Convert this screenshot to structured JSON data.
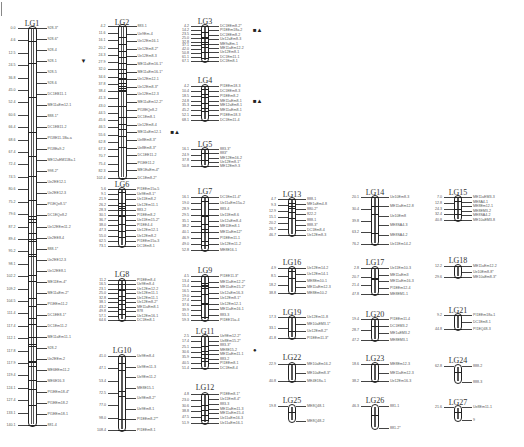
{
  "figure": {
    "caption": "",
    "linkage_groups": [
      {
        "id": "LG1",
        "x": 32,
        "title_y": 19,
        "top": 26,
        "bottom": 427,
        "scale": 2.72,
        "positions": [
          "0.0",
          "4.6",
          "12.5",
          "24.5",
          "36.8",
          "45.0",
          "52.4",
          "60.6",
          "66.4",
          "68.6",
          "67.4",
          "72.4",
          "74.5",
          "80.6",
          "75.2",
          "79.6",
          "87.2",
          "89.4",
          "95.2",
          "98.1",
          "102.2",
          "109.2",
          "104.5",
          "111.4",
          "117.4",
          "112.1",
          "117.8",
          "117.9",
          "119.4",
          "124.1",
          "127.4",
          "133.1",
          "140.1"
        ],
        "markers": [
          "928-3*",
          "928-6*",
          "928-4",
          "928-1",
          "928-5",
          "928-6",
          "DC1EB11-1",
          "ME11aEm12-1",
          "888-1*",
          "DC1EB11-2",
          "PI18E11-1Ba-a",
          "PI18Ea9-2",
          "ME12aEM11Ba-1",
          "998-2*",
          "Ue2EE12-1",
          "Ue2EE12-3",
          "PI1EQe8-5*",
          "DC1EQe8-2",
          "Ue12EEm11-2",
          "Ue2EE8-4",
          "888-1*",
          "Ue2EE12-3",
          "Ue12EE8-1",
          "ME11Em-4*",
          "ME11aEm-2*",
          "PI1EEm11-2",
          "DC1EE8-1*",
          "DC1Em11-2",
          "ME11aEm11-1",
          "928-2",
          "Ue2EEm-2",
          "ME6EEm11-2",
          "ME6E16-3",
          "PI1EEm18-4*",
          "PI1EEm18-2",
          "PI1EEm18-1",
          "881-4"
        ],
        "annotations": [
          {
            "marker_index": 3,
            "symbol": "▼"
          }
        ]
      },
      {
        "id": "LG2",
        "x": 122,
        "title_y": 18,
        "top": 24,
        "bottom": 180,
        "positions": [
          "4.2",
          "11.6",
          "16.1",
          "20.2",
          "24.3",
          "27.9",
          "32.0",
          "34.6",
          "37.8",
          "38.4",
          "41.3",
          "43.0",
          "44.5",
          "45.6",
          "46.5",
          "55.6",
          "62.8",
          "67.3",
          "70.7",
          "75.4",
          "82.3",
          "102.4"
        ],
        "markers": [
          "883-1",
          "Ue9Em-4",
          "Ue12Em16-1",
          "Ue12Em8-2*",
          "Ue12Em8-3",
          "ME11aEm16-1*",
          "ME11aEm16-1*",
          "Ue12Em12-1",
          "Ue12Em8-3*",
          "Ue12Em12-3",
          "ME11aEm12-2*",
          "PI18EQe8-2",
          "DC1Em8-1",
          "Ue12Em8-4",
          "ME11aEm12-1",
          "Ue8Em8-3*",
          "Ue8Em8-3*",
          "DC1EE11-2",
          "PI1EE11-2",
          "ME1EaEm-4*",
          "DC1Em8-2*"
        ],
        "annotations": [
          {
            "marker_index": 14,
            "symbol": "■▲"
          }
        ]
      },
      {
        "id": "LG3",
        "x": 205,
        "title_y": 17,
        "top": 24,
        "bottom": 63,
        "positions": [
          "4.2",
          "14.2",
          "23.5",
          "25.0",
          "32.8",
          "37.1",
          "42.0",
          "50.8",
          "61.1",
          "67.1"
        ],
        "markers": [
          "DC1EEm8-2*",
          "PI1EEm18a-2",
          "DC1EEm8-2",
          "Ue12aEm8-3",
          "ME9aEm-1",
          "ME11aEm12-2",
          "Ue12Em8-1",
          "DC1Em11-1",
          "DC1Em8-1"
        ],
        "annotations": [
          {
            "marker_index": 1,
            "symbol": "■▲"
          }
        ]
      },
      {
        "id": "LG4",
        "x": 205,
        "title_y": 76,
        "top": 84,
        "bottom": 122,
        "positions": [
          "4.2",
          "10.4",
          "18.5",
          "24.8",
          "35.3",
          "45.2",
          "52.1",
          "68.1"
        ],
        "markers": [
          "PI1EEm18-3",
          "DC1EEm8-3",
          "PI1EEm8-2",
          "ME11aEm8-1",
          "ME12aEm8-1",
          "ME11aEm8-1",
          "PI1EEm18-3",
          "DC1Em11-4"
        ],
        "annotations": [
          {
            "marker_index": 3,
            "symbol": "■▲"
          }
        ]
      },
      {
        "id": "LG5",
        "x": 205,
        "title_y": 140,
        "top": 147,
        "bottom": 168,
        "positions": [
          "16.1",
          "24.9",
          "37.8",
          "50.8"
        ],
        "markers": [
          "883-3*",
          "883*",
          "ME12Em16-2",
          "Ue12Em8-1*",
          "ME12Em9-3"
        ],
        "annotations": []
      },
      {
        "id": "LG6",
        "x": 122,
        "title_y": 180,
        "top": 187,
        "bottom": 248,
        "positions": [
          "5.6",
          "9.1",
          "21.9",
          "26.2",
          "28.3",
          "30.1",
          "36.7",
          "38.0",
          "47.3",
          "55.0",
          "62.5",
          "73.1"
        ],
        "markers": [
          "PI1EEm15a-5",
          "Ue9Em8-1*",
          "Ue11Em8-2",
          "Ue12Em11-1",
          "883-2",
          "PI1EEm8-2",
          "Ue11Em15-2*",
          "PI1EE4-4",
          "Ue12Em12-1",
          "Ue12Em8-2",
          "PI1EEm15a-3",
          "DC1Em8-1"
        ],
        "annotations": []
      },
      {
        "id": "LG7",
        "x": 205,
        "title_y": 187,
        "top": 195,
        "bottom": 252,
        "positions": [
          "16.1",
          "19.0",
          "28.9",
          "29.5",
          "35.1",
          "38.2",
          "40.1",
          "46.9",
          "49.0",
          "52.8"
        ],
        "markers": [
          "DC1Em11-4*",
          "Ue11aEm15a-2",
          "883-4",
          "Ue11Em8-6",
          "Ue12aEm8-4",
          "ME11Em8-1",
          "ME11aEm12*",
          "PI1EEm11-1",
          "Ue12Em11-2",
          "ME8E16-1"
        ],
        "annotations": []
      },
      {
        "id": "LG8",
        "x": 122,
        "title_y": 270,
        "top": 278,
        "bottom": 322,
        "positions": [
          "11.2",
          "16.5",
          "23.1",
          "25.0",
          "32.8",
          "38.1",
          "43.2",
          "49.8",
          "57.1",
          "64.6"
        ],
        "markers": [
          "PI1EEm8-4",
          "Ue9Em8-4",
          "Ue12Em12-2",
          "Ue12Em11-1",
          "Ue12Em11-1",
          "Ue12Em8-2*",
          "ME11aEm8-1",
          "878",
          "Ue12Em16-1",
          "DC1Em8-1"
        ],
        "annotations": []
      },
      {
        "id": "LG9",
        "x": 205,
        "title_y": 266,
        "top": 274,
        "bottom": 322,
        "positions": [
          "4.5",
          "13.4",
          "15.4",
          "16.5",
          "19.0",
          "27.4",
          "37.6",
          "39.9",
          "55.1",
          "59.3"
        ],
        "markers": [
          "PI1EE11-3*",
          "ME11aEm12-2*",
          "ME11aEm15-2*",
          "Ue12aEm16-3",
          "Ue12Em8-1*",
          "Ue12Em12-1",
          "ME11aEm16-1",
          "883-3",
          "PI1EE15a-4"
        ],
        "annotations": []
      },
      {
        "id": "LG10",
        "x": 122,
        "title_y": 346,
        "top": 354,
        "bottom": 432,
        "positions": [
          "41.0",
          "47.1",
          "53.4",
          "72.5",
          "77.0",
          "98.0",
          "108.4"
        ],
        "markers": [
          "Ue9Em8-4",
          "Ue9Em11-3",
          "Ue9Em11-2",
          "ME8E15-1",
          "Ue9Em8-2*",
          "Ue9Em8-1",
          "PI1EEm8-2**",
          "PI1EEm8-1"
        ],
        "annotations": []
      },
      {
        "id": "LG11",
        "x": 205,
        "title_y": 327,
        "top": 334,
        "bottom": 370,
        "positions": [
          "2.5",
          "17.4",
          "25.1",
          "30.6",
          "35.9",
          "40.5",
          "51.4"
        ],
        "markers": [
          "Ue9Em12-2*",
          "Ue8Em15-2*",
          "883-3*",
          "ME8E15-2",
          "ME11aEm11-1",
          "883-2",
          "PI1EEm8-1",
          "DC1Em8-4"
        ],
        "annotations": [
          {
            "marker_index": 3,
            "symbol": "●"
          }
        ]
      },
      {
        "id": "LG12",
        "x": 205,
        "title_y": 383,
        "top": 392,
        "bottom": 425,
        "positions": [
          "4.8",
          "23.0",
          "30.6",
          "38.8",
          "47.5",
          "51.9"
        ],
        "markers": [
          "PI1EEm8-1*",
          "Ue11Em8-4*",
          "883-3",
          "ME11aEm11-3",
          "ME11aEm15-4",
          "Ue11aEm16-3",
          "Ue11aEm16-1"
        ],
        "annotations": []
      },
      {
        "id": "LG13",
        "x": 292,
        "title_y": 190,
        "top": 197,
        "bottom": 237,
        "positions": [
          "4.7",
          "9.3",
          "12.9",
          "15.1",
          "20.2",
          "26.7",
          "46.7"
        ],
        "markers": [
          "888-1",
          "ME1aEm4-8",
          "880-2*",
          "822-2",
          "888-1",
          "888-3*",
          "DC1Em8-4",
          "Ue12Em8-3"
        ],
        "annotations": []
      },
      {
        "id": "LG14",
        "x": 375,
        "title_y": 188,
        "top": 195,
        "bottom": 246,
        "positions": [
          "20.1",
          "30.4",
          "39.8",
          "63.2",
          "76.2"
        ],
        "markers": [
          "Ue10Em8-3",
          "ME11aEm12-8",
          "Ue10Em8",
          "ME8SA4-3",
          "ME8SA4-2",
          "Ue11Em14-2"
        ],
        "annotations": []
      },
      {
        "id": "LG15",
        "x": 458,
        "title_y": 188,
        "top": 195,
        "bottom": 222,
        "positions": [
          "7.0",
          "12.8",
          "24.3",
          "32.4",
          "40.8"
        ],
        "markers": [
          "ME11aEM3-3",
          "ME8A4-1",
          "ME8Em12-1",
          "ME8EM3-2",
          "ME8SA4-2",
          "ME10aEM3-8"
        ],
        "annotations": []
      },
      {
        "id": "LG16",
        "x": 292,
        "title_y": 258,
        "top": 266,
        "bottom": 295,
        "positions": [
          "4.9",
          "8.5",
          "18.2",
          "38.8"
        ],
        "markers": [
          "Ue12Em14-2",
          "Ue12Em14-1",
          "ME8Em10-1",
          "ME11aEm12-3",
          "ME8Em10-2"
        ],
        "annotations": []
      },
      {
        "id": "LG17",
        "x": 375,
        "title_y": 258,
        "top": 266,
        "bottom": 296,
        "positions": [
          "2.8",
          "20.7",
          "21.4",
          "47.8"
        ],
        "markers": [
          "Ue11Em10-3",
          "ME11aEm3",
          "ME11aEm16-3",
          "PI1EEm12-4",
          "ME8EM1-1"
        ],
        "annotations": []
      },
      {
        "id": "LG18",
        "x": 458,
        "title_y": 256,
        "top": 264,
        "bottom": 279,
        "positions": [
          "12.2",
          "29.6"
        ],
        "markers": [
          "ME11aEm12-2",
          "Ue10Em8-8*",
          "ME10aEm8-3*"
        ],
        "annotations": []
      },
      {
        "id": "LG19",
        "x": 292,
        "title_y": 308,
        "top": 315,
        "bottom": 340,
        "positions": [
          "17.3",
          "33.1",
          "41.8"
        ],
        "markers": [
          "Ue12Em11-8",
          "ME10aEM3-1*",
          "Ue12Em8-2*",
          "PI1EEm11-3*"
        ],
        "annotations": []
      },
      {
        "id": "LG20",
        "x": 375,
        "title_y": 310,
        "top": 317,
        "bottom": 342,
        "positions": [
          "19.4",
          "28.7",
          "47.2"
        ],
        "markers": [
          "PI1EEm11-4",
          "DC1EM3-2",
          "ME1aEM3-2",
          "ME8EM3-1"
        ],
        "annotations": []
      },
      {
        "id": "LG21",
        "x": 458,
        "title_y": 306,
        "top": 313,
        "bottom": 331,
        "positions": [
          "9.2",
          "44.8"
        ],
        "markers": [
          "PI1EEm18a-1",
          "DC1Em8-1",
          "PI1EQ48-3"
        ],
        "annotations": []
      },
      {
        "id": "LG22",
        "x": 292,
        "title_y": 353,
        "top": 362,
        "bottom": 383,
        "positions": [
          "22.9",
          "40.8"
        ],
        "markers": [
          "ME10aEm16-2",
          "ME10aEm8-3*",
          "ME4E18a-1"
        ],
        "annotations": []
      },
      {
        "id": "LG23",
        "x": 375,
        "title_y": 354,
        "top": 362,
        "bottom": 383,
        "positions": [
          "18.6",
          "38.2"
        ],
        "markers": [
          "ME8Em12-3",
          "ME11aEm12-3",
          "Ue12Em16-3"
        ],
        "annotations": []
      },
      {
        "id": "LG24",
        "x": 458,
        "title_y": 356,
        "top": 364,
        "bottom": 384,
        "positions": [
          "62.8"
        ],
        "markers": [
          "888-2",
          "888-3"
        ],
        "annotations": []
      },
      {
        "id": "LG25",
        "x": 292,
        "title_y": 396,
        "top": 404,
        "bottom": 423,
        "positions": [
          "19.8"
        ],
        "markers": [
          "ME8Q48-1",
          "ME8Q48-2"
        ],
        "annotations": []
      },
      {
        "id": "LG26",
        "x": 375,
        "title_y": 396,
        "top": 404,
        "bottom": 430,
        "positions": [
          "46.3"
        ],
        "markers": [
          "881-1",
          "881-2*"
        ],
        "annotations": []
      },
      {
        "id": "LG27",
        "x": 458,
        "title_y": 398,
        "top": 405,
        "bottom": 422,
        "positions": [
          "21.6"
        ],
        "markers": [
          "Ue8Em11-1",
          "9"
        ],
        "annotations": []
      }
    ]
  },
  "colors": {
    "line": "#222222",
    "text": "#555555",
    "title": "#333333"
  }
}
